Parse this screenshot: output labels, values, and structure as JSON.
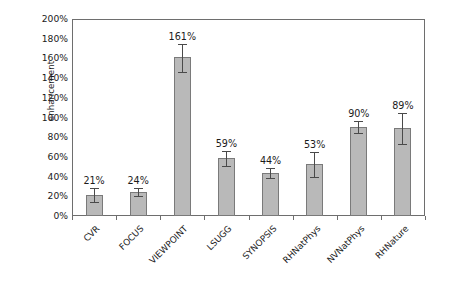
{
  "chart_data": {
    "type": "bar",
    "title": "",
    "xlabel": "",
    "ylabel": "enhancement",
    "ylim": [
      0,
      200
    ],
    "ytick_labels": [
      "200%",
      "180%",
      "160%",
      "140%",
      "120%",
      "100%",
      "80%",
      "60%",
      "40%",
      "20%",
      "0%"
    ],
    "ytick_values": [
      200,
      180,
      160,
      140,
      120,
      100,
      80,
      60,
      40,
      20,
      0
    ],
    "grid": false,
    "legend": null,
    "categories": [
      "CVR",
      "FOCUS",
      "VIEWPOINT",
      "LSUGG",
      "SYNOPSIS",
      "RHNatPhys",
      "NVNatPhys",
      "RHNature"
    ],
    "values": [
      21,
      24,
      161,
      59,
      44,
      53,
      90,
      89
    ],
    "data_labels": [
      "21%",
      "24%",
      "161%",
      "59%",
      "44%",
      "53%",
      "90%",
      "89%"
    ],
    "error_low": [
      14,
      20,
      146,
      51,
      39,
      40,
      84,
      73
    ],
    "error_high": [
      28,
      28,
      175,
      66,
      49,
      65,
      96,
      105
    ],
    "bar_color": "#b9b9b9",
    "bar_border_color": "#7a7a7a",
    "error_bar_color": "#4a4a4a",
    "axis_color": "#6e6e6e",
    "text_color": "#1b1b1b",
    "background": "#ffffff"
  }
}
